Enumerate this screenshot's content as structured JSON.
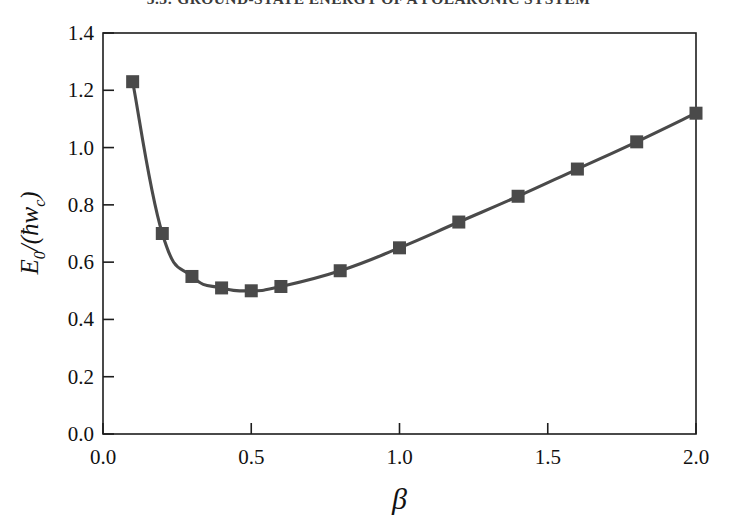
{
  "header": {
    "running_title": "5.3: GROUND-STATE ENERGY OF A POLARONIC SYSTEM"
  },
  "chart_data": {
    "type": "line",
    "title": "",
    "subtitle": "",
    "xlabel": "β",
    "ylabel": "E₀/(ħw_c)",
    "ylabel_parts": {
      "symbol": "E",
      "subscript": "0",
      "divider": "/(",
      "hbar": "ħ",
      "omega": "w",
      "omega_sub": "c",
      "close": ")"
    },
    "xlim": [
      0.0,
      2.0
    ],
    "ylim": [
      0.0,
      1.4
    ],
    "xticks": [
      0.0,
      0.5,
      1.0,
      1.5,
      2.0
    ],
    "xtick_labels": [
      "0.0",
      "0.5",
      "1.0",
      "1.5",
      "2.0"
    ],
    "yticks": [
      0.0,
      0.2,
      0.4,
      0.6,
      0.8,
      1.0,
      1.2,
      1.4
    ],
    "ytick_labels": [
      "0.0",
      "0.2",
      "0.4",
      "0.6",
      "0.8",
      "1.0",
      "1.2",
      "1.4"
    ],
    "grid": false,
    "legend": false,
    "legend_position": "none",
    "marker": "square",
    "marker_size": 13,
    "line_color": "#4a4a4a",
    "marker_color": "#4a4a4a",
    "axis_color": "#1d1d1d",
    "background_color": "#ffffff",
    "x": [
      0.1,
      0.2,
      0.3,
      0.4,
      0.5,
      0.6,
      0.8,
      1.0,
      1.2,
      1.4,
      1.6,
      1.8,
      2.0
    ],
    "y": [
      1.23,
      0.7,
      0.55,
      0.51,
      0.5,
      0.515,
      0.57,
      0.65,
      0.74,
      0.83,
      0.925,
      1.02,
      1.12
    ],
    "series": [
      {
        "name": "E0",
        "x": [
          0.1,
          0.2,
          0.3,
          0.4,
          0.5,
          0.6,
          0.8,
          1.0,
          1.2,
          1.4,
          1.6,
          1.8,
          2.0
        ],
        "values": [
          1.23,
          0.7,
          0.55,
          0.51,
          0.5,
          0.515,
          0.57,
          0.65,
          0.74,
          0.83,
          0.925,
          1.02,
          1.12
        ]
      }
    ],
    "minimum": {
      "x": 0.5,
      "y": 0.5
    }
  }
}
